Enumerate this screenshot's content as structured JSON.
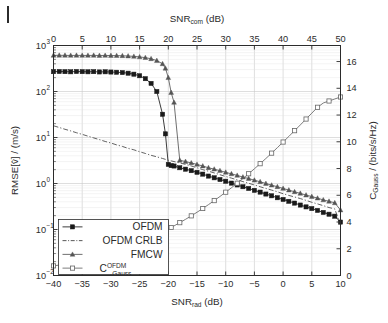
{
  "figure": {
    "title": "",
    "page_mark": "page-edge-mark"
  },
  "axes": {
    "top": {
      "label": "SNR",
      "label_sub": "com",
      "label_unit": " (dB)",
      "full_label": "SNR_com (dB)",
      "ticks": [
        0,
        5,
        10,
        15,
        20,
        25,
        30,
        35,
        40,
        45,
        50
      ],
      "range": [
        0,
        50
      ]
    },
    "bottom": {
      "label": "SNR",
      "label_sub": "rad",
      "label_unit": " (dB)",
      "full_label": "SNR_rad (dB)",
      "ticks": [
        -40,
        -35,
        -30,
        -25,
        -20,
        -15,
        -10,
        -5,
        0,
        5,
        10
      ],
      "range": [
        -40,
        10
      ]
    },
    "left": {
      "label": "RMSE[v̂] / (m/s)",
      "scale": "log",
      "ticks": [
        -2,
        -1,
        0,
        1,
        2,
        3
      ],
      "tick_labels": [
        "10⁻²",
        "10⁻¹",
        "10⁰",
        "10¹",
        "10²",
        "10³"
      ],
      "range": [
        -2,
        3
      ]
    },
    "right": {
      "label_main": "C",
      "label_sub": "Gauss",
      "label_unit": " / (bits/s/Hz)",
      "full_label": "C_Gauss / (bits/s/Hz)",
      "ticks": [
        0,
        2,
        4,
        6,
        8,
        10,
        12,
        14,
        16
      ],
      "range": [
        0,
        17.2
      ]
    }
  },
  "legend": {
    "items": [
      {
        "label": "OFDM",
        "marker": "filled-square",
        "line": "solid",
        "axis": "left"
      },
      {
        "label": "OFDM CRLB",
        "marker": "none",
        "line": "dashdot",
        "axis": "left"
      },
      {
        "label": "FMCW",
        "marker": "triangle",
        "line": "solid",
        "axis": "left"
      },
      {
        "label": "C",
        "label_sup": "OFDM",
        "label_sub": "Gauss",
        "marker": "open-square",
        "line": "solid",
        "axis": "right"
      }
    ]
  },
  "colors": {
    "axis": "#2b2b2b",
    "grid": "#c8c8c8",
    "ofdm": "#1a1a1a",
    "crlb": "#3a3a3a",
    "fmcw": "#555555",
    "capacity": "#666666",
    "background": "#ffffff"
  },
  "chart_data": {
    "type": "line",
    "title": "",
    "xlabel": "SNR_rad (dB)",
    "xlabel_top": "SNR_com (dB)",
    "ylabel": "RMSE[v̂] / (m/s)",
    "ylabel_right": "C_Gauss / (bits/s/Hz)",
    "yscale": "log",
    "xlim": [
      -40,
      10
    ],
    "xlim_top": [
      0,
      50
    ],
    "ylim": [
      0.01,
      1000
    ],
    "ylim_right": [
      0,
      17.2
    ],
    "grid": true,
    "legend_position": "lower-left",
    "x": [
      -40,
      -39,
      -38,
      -37,
      -36,
      -35,
      -34,
      -33,
      -32,
      -31,
      -30,
      -29,
      -28,
      -27,
      -26,
      -25,
      -24,
      -23,
      -22,
      -21,
      -20.5,
      -20,
      -19.5,
      -19,
      -18,
      -17,
      -16,
      -15,
      -14,
      -13,
      -12,
      -11,
      -10,
      -9,
      -8,
      -7,
      -6,
      -5,
      -4,
      -3,
      -2,
      -1,
      0,
      1,
      2,
      3,
      4,
      5,
      6,
      7,
      8,
      9,
      10
    ],
    "series": [
      {
        "name": "OFDM",
        "axis": "left",
        "marker": "filled-square",
        "values": [
          270,
          272,
          270,
          268,
          272,
          270,
          268,
          270,
          266,
          268,
          265,
          262,
          258,
          250,
          238,
          220,
          190,
          150,
          100,
          32,
          12,
          2.6,
          2.45,
          2.4,
          2.2,
          2.05,
          1.9,
          1.75,
          1.6,
          1.45,
          1.33,
          1.22,
          1.12,
          1.02,
          0.93,
          0.85,
          0.78,
          0.71,
          0.65,
          0.59,
          0.54,
          0.49,
          0.45,
          0.41,
          0.375,
          0.34,
          0.31,
          0.285,
          0.26,
          0.235,
          0.215,
          0.195,
          0.145
        ]
      },
      {
        "name": "OFDM CRLB",
        "axis": "left",
        "marker": "none",
        "line": "dashdot",
        "values": [
          18.0,
          16.5,
          15.1,
          13.9,
          12.7,
          11.7,
          10.7,
          9.8,
          9.0,
          8.2,
          7.6,
          6.9,
          6.4,
          5.8,
          5.4,
          4.9,
          4.5,
          4.1,
          3.8,
          3.5,
          3.35,
          3.2,
          3.1,
          3.0,
          2.8,
          2.6,
          2.4,
          2.2,
          2.0,
          1.85,
          1.7,
          1.55,
          1.42,
          1.31,
          1.2,
          1.1,
          1.01,
          0.93,
          0.85,
          0.78,
          0.72,
          0.66,
          0.6,
          0.55,
          0.51,
          0.47,
          0.43,
          0.39,
          0.36,
          0.33,
          0.3,
          0.28,
          0.125
        ]
      },
      {
        "name": "FMCW",
        "axis": "left",
        "marker": "triangle",
        "values": [
          610,
          612,
          610,
          608,
          610,
          609,
          608,
          610,
          606,
          608,
          605,
          602,
          598,
          590,
          580,
          565,
          545,
          515,
          470,
          400,
          320,
          200,
          95,
          58,
          3.2,
          3.0,
          2.8,
          2.6,
          2.4,
          2.2,
          2.05,
          1.9,
          1.75,
          1.62,
          1.5,
          1.38,
          1.28,
          1.18,
          1.09,
          1.0,
          0.92,
          0.85,
          0.78,
          0.72,
          0.66,
          0.61,
          0.56,
          0.52,
          0.48,
          0.44,
          0.41,
          0.38,
          0.265
        ]
      },
      {
        "name": "C_Gauss^OFDM",
        "axis": "right",
        "marker": "open-square",
        "values": [
          0.72,
          0.78,
          0.85,
          0.92,
          1.0,
          1.08,
          1.17,
          1.27,
          1.38,
          1.5,
          1.63,
          1.77,
          1.92,
          2.08,
          2.25,
          2.43,
          2.62,
          2.82,
          3.03,
          3.25,
          3.36,
          3.48,
          3.59,
          3.71,
          3.95,
          4.2,
          4.46,
          4.73,
          5.01,
          5.3,
          5.6,
          5.91,
          6.23,
          6.56,
          6.9,
          7.25,
          7.61,
          7.98,
          8.36,
          8.75,
          9.15,
          9.56,
          9.98,
          10.4,
          10.83,
          11.26,
          11.7,
          12.14,
          12.58,
          12.9,
          13.05,
          13.2,
          13.35
        ]
      }
    ]
  }
}
